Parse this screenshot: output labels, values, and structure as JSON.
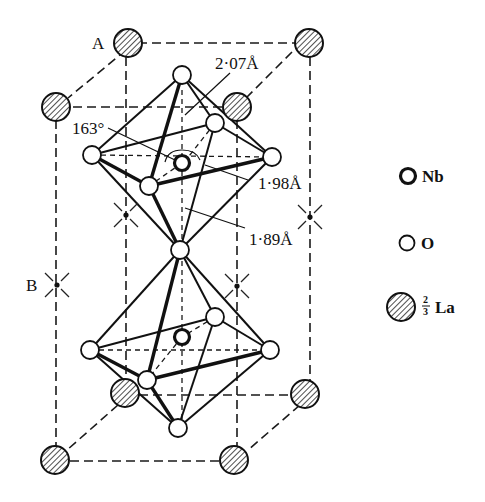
{
  "figure": {
    "site_labels": {
      "A": "A",
      "B": "B"
    },
    "annotations": {
      "bond_long": "2·07Å",
      "angle": "163°",
      "bond_mid": "1·98Å",
      "bond_short": "1·89Å"
    },
    "legend": [
      {
        "symbol": "nb-atom",
        "label": "Nb"
      },
      {
        "symbol": "o-atom",
        "label": "O"
      },
      {
        "symbol": "la-atom",
        "fraction_num": "2",
        "fraction_den": "3",
        "label": "La"
      }
    ],
    "colors": {
      "ink": "#111111",
      "background": "#ffffff"
    }
  }
}
